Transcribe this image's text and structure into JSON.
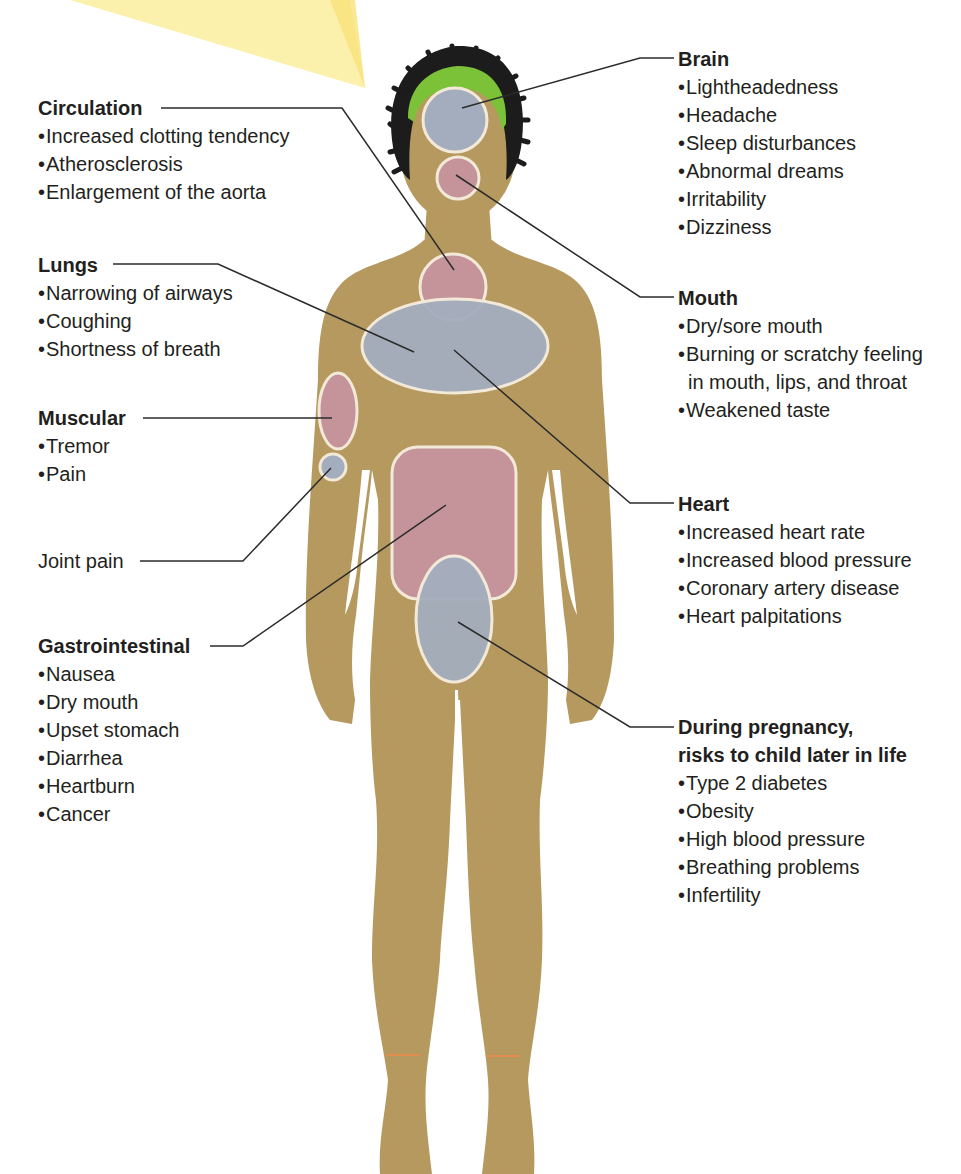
{
  "figure": {
    "colors": {
      "skin": "#b5995f",
      "hair": "#1c1c1c",
      "headband": "#7cc238",
      "region_blue": "#a3adbd",
      "region_red": "#c4949a",
      "region_outline": "#f3e9d8",
      "leader_line": "#2b2b2b",
      "light_ray": "#fcef9e",
      "ankle_line": "#f08a4b"
    }
  },
  "labels": {
    "circulation": {
      "title": "Circulation",
      "items": [
        "Increased clotting tendency",
        "Atherosclerosis",
        "Enlargement of the aorta"
      ]
    },
    "lungs": {
      "title": "Lungs",
      "items": [
        "Narrowing of airways",
        "Coughing",
        "Shortness of breath"
      ]
    },
    "muscular": {
      "title": "Muscular",
      "items": [
        "Tremor",
        "Pain"
      ]
    },
    "joint": {
      "title": "Joint pain"
    },
    "gastrointestinal": {
      "title": "Gastrointestinal",
      "items": [
        "Nausea",
        "Dry mouth",
        "Upset stomach",
        "Diarrhea",
        "Heartburn",
        "Cancer"
      ]
    },
    "brain": {
      "title": "Brain",
      "items": [
        "Lightheadedness",
        "Headache",
        "Sleep disturbances",
        "Abnormal dreams",
        "Irritability",
        "Dizziness"
      ]
    },
    "mouth": {
      "title": "Mouth",
      "items": [
        "Dry/sore mouth",
        "Burning or scratchy feeling",
        "in mouth, lips, and throat",
        "Weakened taste"
      ]
    },
    "heart": {
      "title": "Heart",
      "items": [
        "Increased heart rate",
        "Increased blood pressure",
        "Coronary artery disease",
        "Heart palpitations"
      ]
    },
    "pregnancy": {
      "title_line1": "During pregnancy,",
      "title_line2": "risks to child later in life",
      "items": [
        "Type 2 diabetes",
        "Obesity",
        "High blood pressure",
        "Breathing problems",
        "Infertility"
      ]
    }
  },
  "bullet": "•"
}
